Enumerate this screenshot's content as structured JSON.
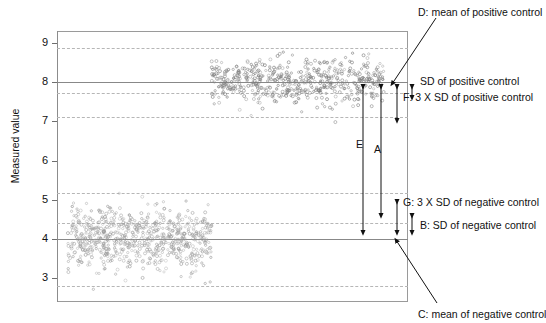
{
  "chart_data": {
    "type": "scatter",
    "title": "",
    "xlabel": "",
    "ylabel": "Measured value",
    "ylim": [
      2.4,
      9.3
    ],
    "yticks": [
      3,
      4,
      5,
      6,
      7,
      8,
      9
    ],
    "ytick_labels": [
      "3",
      "4",
      "5",
      "6",
      "7",
      "8",
      "9"
    ],
    "grid": false,
    "legend_position": "none",
    "series": [
      {
        "name": "negative control",
        "mean": 4.0,
        "sd": 0.39,
        "n": 700,
        "x_range": [
          0.03,
          0.44
        ],
        "marker": "open-circle",
        "color": "#9c9c9c"
      },
      {
        "name": "positive control",
        "mean": 8.0,
        "sd": 0.29,
        "n": 560,
        "x_range": [
          0.44,
          0.935
        ],
        "marker": "open-circle",
        "color": "#7d7d7d"
      }
    ],
    "reference_lines": [
      {
        "id": "D",
        "value": 8.0,
        "style": "solid",
        "label": "mean of positive control"
      },
      {
        "id": "C",
        "value": 4.0,
        "style": "solid",
        "label": "mean of negative control"
      },
      {
        "id": "pos_plus_3sd",
        "value": 8.87,
        "style": "dashed",
        "label": "positive control +3 SD"
      },
      {
        "id": "pos_minus_1sd",
        "value": 7.72,
        "style": "dashed",
        "label": "positive control -1 SD"
      },
      {
        "id": "pos_minus_3sd",
        "value": 7.12,
        "style": "dashed",
        "label": "positive control -3 SD"
      },
      {
        "id": "neg_plus_3sd",
        "value": 5.17,
        "style": "dashed",
        "label": "negative control +3 SD"
      },
      {
        "id": "neg_plus_1sd",
        "value": 4.42,
        "style": "dashed",
        "label": "negative control +1 SD"
      },
      {
        "id": "neg_minus_3sd",
        "value": 2.82,
        "style": "dashed",
        "label": "negative control -3 SD"
      }
    ],
    "annotations": [
      {
        "id": "A",
        "letter": "A",
        "from": 8.0,
        "to": 4.42,
        "description": "span from mean of positive control to negative control + 1 SD"
      },
      {
        "id": "B",
        "letter": "B",
        "from": 4.42,
        "to": 4.0,
        "description": "SD of negative control"
      },
      {
        "id": "E",
        "letter": "E",
        "from": 8.0,
        "to": 4.0,
        "description": "span between the two means"
      },
      {
        "id": "F",
        "letter": "F",
        "from": 8.0,
        "to": 7.12,
        "description": "3 X SD of positive control"
      },
      {
        "id": "G",
        "letter": "G",
        "from": 5.17,
        "to": 4.0,
        "description": "3 X SD of negative control"
      },
      {
        "id": "SDpos",
        "letter": "",
        "from": 8.0,
        "to": 7.72,
        "description": "SD of positive control"
      }
    ]
  },
  "axis": {
    "y_title": "Measured value",
    "ticks": [
      "9",
      "8",
      "7",
      "6",
      "5",
      "4",
      "3"
    ]
  },
  "callouts": {
    "d_label": "D: mean of positive control",
    "c_label": "C: mean of negative control",
    "sd_positive": "SD of positive control",
    "f_label": "F: 3 X SD of positive control",
    "g_label": "G: 3 X SD of negative control",
    "b_label": "B: SD of negative control",
    "letter_a": "A",
    "letter_e": "E"
  }
}
